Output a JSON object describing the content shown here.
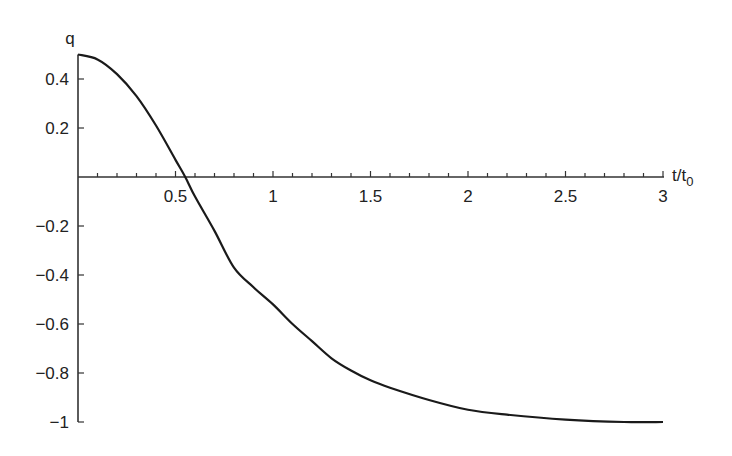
{
  "chart_data": {
    "type": "line",
    "title": "",
    "xlabel": "t/t0",
    "xlabel_main": "t/t",
    "xlabel_sub": "0",
    "ylabel": "q",
    "xlim": [
      0,
      3
    ],
    "ylim": [
      -1,
      0.5
    ],
    "grid": false,
    "legend": null,
    "x_ticks": [
      0.5,
      1,
      1.5,
      2,
      2.5,
      3
    ],
    "x_tick_labels": [
      "0.5",
      "1",
      "1.5",
      "2",
      "2.5",
      "3"
    ],
    "y_ticks": [
      0.4,
      0.2,
      -0.2,
      -0.4,
      -0.6,
      -0.8,
      -1
    ],
    "y_tick_labels": [
      "0.4",
      "0.2",
      "−0.2",
      "−0.4",
      "−0.6",
      "−0.8",
      "−1"
    ],
    "series": [
      {
        "name": "q(t/t0)",
        "x": [
          0,
          0.1,
          0.2,
          0.3,
          0.4,
          0.5,
          0.55,
          0.6,
          0.7,
          0.8,
          0.9,
          1.0,
          1.1,
          1.2,
          1.3,
          1.4,
          1.5,
          1.6,
          1.8,
          2.0,
          2.2,
          2.5,
          2.8,
          3.0
        ],
        "values": [
          0.5,
          0.48,
          0.42,
          0.33,
          0.21,
          0.07,
          0.0,
          -0.08,
          -0.22,
          -0.37,
          -0.45,
          -0.52,
          -0.6,
          -0.67,
          -0.74,
          -0.79,
          -0.83,
          -0.86,
          -0.91,
          -0.95,
          -0.97,
          -0.99,
          -1.0,
          -1.0
        ],
        "color": "#1a1a1a"
      }
    ]
  }
}
